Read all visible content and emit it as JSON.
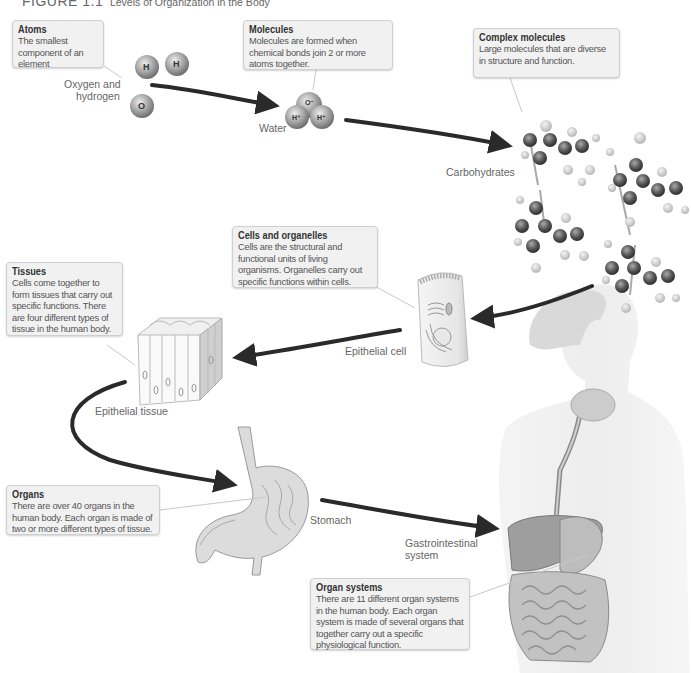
{
  "figure": {
    "number": "FIGURE 1.1",
    "caption": "Levels of Organization in the Body"
  },
  "callouts": {
    "atoms": {
      "title": "Atoms",
      "body": "The smallest component of an element"
    },
    "molecules": {
      "title": "Molecules",
      "body": "Molecules are formed when chemical bonds join 2 or more atoms together."
    },
    "complex_molecules": {
      "title": "Complex molecules",
      "body": "Large molecules that are diverse in structure and function."
    },
    "cells": {
      "title": "Cells and organelles",
      "body": "Cells are the structural and functional units of living organisms. Organelles carry out specific functions within cells."
    },
    "tissues": {
      "title": "Tissues",
      "body": "Cells come together to form tissues that carry out specific functions. There are four different types of tissue in the human body."
    },
    "organs": {
      "title": "Organs",
      "body": "There are over 40 organs in the human body. Each organ is made of two or more different types of tissue."
    },
    "organ_systems": {
      "title": "Organ systems",
      "body": "There are 11 different organ systems in the human body. Each organ system is made of several organs that together carry out a specific physiological function."
    }
  },
  "labels": {
    "oxygen_hydrogen_line1": "Oxygen and",
    "oxygen_hydrogen_line2": "hydrogen",
    "water": "Water",
    "carbohydrates": "Carbohydrates",
    "epithelial_cell": "Epithelial cell",
    "epithelial_tissue": "Epithelial tissue",
    "stomach": "Stomach",
    "gi_line1": "Gastrointestinal",
    "gi_line2": "system"
  },
  "atom_symbols": {
    "hydrogen": "H",
    "oxygen": "O",
    "carbon": "C",
    "water_oxygen": "O⁻",
    "water_hydrogen": "H⁺"
  },
  "colors": {
    "arrow": "#2a2a2a",
    "callout_bg": "#f1f1f1",
    "callout_border": "#cfcfcf",
    "atom_gray": "#9a9a9a",
    "carbon_dark": "#555555"
  }
}
